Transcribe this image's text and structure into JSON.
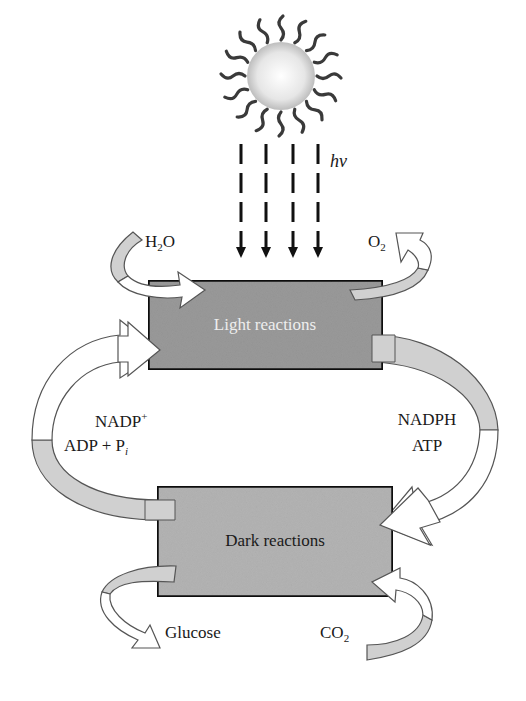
{
  "diagram": {
    "light_source": {
      "icon": "sun-icon",
      "label": "hν"
    },
    "boxes": {
      "light": {
        "label": "Light reactions",
        "fill": "#9a9a9a",
        "text_color": "#eeeeee"
      },
      "dark": {
        "label": "Dark reactions",
        "fill": "#b4b4b4",
        "text_color": "#1a1a1a"
      }
    },
    "inputs_outputs": {
      "water": {
        "main": "H",
        "sub": "2",
        "tail": "O"
      },
      "oxygen": {
        "main": "O",
        "sub": "2"
      },
      "glucose": "Glucose",
      "co2": {
        "main": "CO",
        "sub": "2"
      }
    },
    "cycle_left": {
      "line1_main": "NADP",
      "line1_sup": "+",
      "line2_main": "ADP + P",
      "line2_sub": "i"
    },
    "cycle_right": {
      "line1": "NADPH",
      "line2": "ATP"
    },
    "colors": {
      "arrow_fill_light": "#d0d0d0",
      "arrow_fill_white": "#ffffff",
      "outline": "#555555",
      "border": "#111111"
    }
  }
}
